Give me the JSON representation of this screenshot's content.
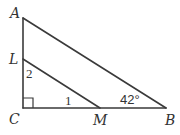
{
  "diagram": {
    "type": "right-triangle-geometry",
    "points": {
      "A": {
        "label": "A",
        "x": 23,
        "y": 18
      },
      "L": {
        "label": "L",
        "x": 23,
        "y": 59
      },
      "C": {
        "label": "C",
        "x": 23,
        "y": 108
      },
      "M": {
        "label": "M",
        "x": 100,
        "y": 108
      },
      "B": {
        "label": "B",
        "x": 166,
        "y": 108
      }
    },
    "segments": [
      {
        "from": "A",
        "to": "C"
      },
      {
        "from": "C",
        "to": "B"
      },
      {
        "from": "A",
        "to": "B"
      },
      {
        "from": "L",
        "to": "M"
      }
    ],
    "right_angle_at": "C",
    "angle_labels": {
      "angle1": "1",
      "angle2": "2",
      "angleB": "42°"
    },
    "colors": {
      "line": "#3a3a3a",
      "text": "#333333",
      "background": "#ffffff"
    }
  }
}
